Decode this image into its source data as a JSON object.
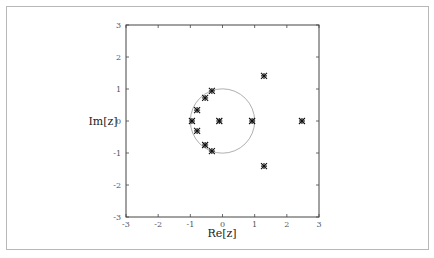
{
  "chart_data": {
    "type": "scatter",
    "title": "",
    "xlabel": "Re[z]",
    "ylabel": "Im[z]",
    "xlim": [
      -3,
      3
    ],
    "ylim": [
      -3,
      3
    ],
    "xticks": [
      "-3",
      "-2",
      "-1",
      "0",
      "1",
      "2",
      "3"
    ],
    "yticks": [
      "3",
      "2",
      "1",
      "0",
      "-1",
      "-2",
      "-3"
    ],
    "grid": false,
    "legend": null,
    "annotations": [
      {
        "type": "circle",
        "center": [
          0,
          0
        ],
        "radius": 1,
        "label": "unit circle"
      }
    ],
    "series": [
      {
        "name": "points",
        "marker": "asterisk",
        "points": [
          {
            "x": -0.33,
            "y": 0.94
          },
          {
            "x": -0.54,
            "y": 0.72
          },
          {
            "x": -0.79,
            "y": 0.34
          },
          {
            "x": -0.95,
            "y": 0.0
          },
          {
            "x": -0.79,
            "y": -0.31
          },
          {
            "x": -0.54,
            "y": -0.75
          },
          {
            "x": -0.33,
            "y": -0.94
          },
          {
            "x": -0.1,
            "y": 0.0
          },
          {
            "x": 0.92,
            "y": 0.0
          },
          {
            "x": 2.47,
            "y": 0.0
          },
          {
            "x": 1.29,
            "y": 1.41
          },
          {
            "x": 1.29,
            "y": -1.41
          }
        ]
      }
    ]
  }
}
